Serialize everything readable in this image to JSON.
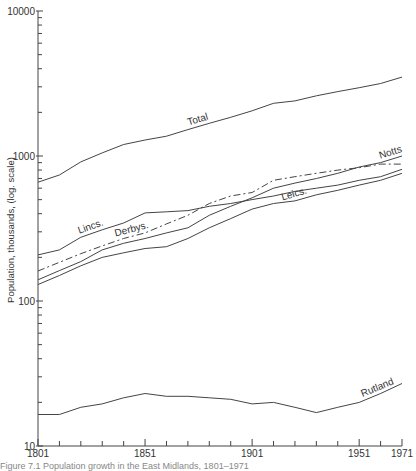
{
  "chart_data": {
    "type": "line",
    "title": "",
    "xlabel": "",
    "ylabel": "Population, thousands, (log. scale)",
    "yscale": "log",
    "ylim": [
      10,
      10000
    ],
    "xlim": [
      1801,
      1971
    ],
    "grid": false,
    "legend": "inline labels",
    "y_ticks": [
      10,
      100,
      1000,
      10000
    ],
    "y_tick_labels": [
      "10",
      "100",
      "1000",
      "10000"
    ],
    "x_tick_labels": [
      "1801",
      "1851",
      "1901",
      "1951",
      "1971"
    ],
    "x_label_years": [
      1801,
      1851,
      1901,
      1951,
      1971
    ],
    "x_minor_tick_step": 10,
    "x": [
      1801,
      1811,
      1821,
      1831,
      1841,
      1851,
      1861,
      1871,
      1881,
      1891,
      1901,
      1911,
      1921,
      1931,
      1941,
      1951,
      1961,
      1971
    ],
    "series": [
      {
        "name": "Total",
        "style": "solid",
        "label_year": 1876,
        "values": [
          660,
          740,
          910,
          1050,
          1200,
          1290,
          1370,
          1520,
          1680,
          1850,
          2050,
          2310,
          2400,
          2600,
          2780,
          2960,
          3160,
          3500
        ]
      },
      {
        "name": "Lincs.",
        "style": "solid",
        "label_year": 1826,
        "values": [
          208,
          225,
          275,
          310,
          345,
          405,
          412,
          420,
          450,
          470,
          500,
          530,
          570,
          600,
          630,
          680,
          720,
          810
        ]
      },
      {
        "name": "Derbys.",
        "style": "dashed",
        "label_year": 1845,
        "values": [
          161,
          185,
          212,
          240,
          270,
          295,
          340,
          390,
          470,
          530,
          560,
          680,
          720,
          760,
          800,
          830,
          880,
          880
        ]
      },
      {
        "name": "Notts",
        "style": "solid",
        "label_year": 1966,
        "values": [
          140,
          162,
          187,
          225,
          250,
          270,
          295,
          320,
          390,
          450,
          515,
          600,
          650,
          700,
          760,
          840,
          900,
          1000
        ]
      },
      {
        "name": "Leics.",
        "style": "solid",
        "label_year": 1921,
        "values": [
          130,
          150,
          175,
          200,
          215,
          230,
          237,
          270,
          320,
          370,
          430,
          470,
          490,
          540,
          580,
          630,
          680,
          760
        ]
      },
      {
        "name": "Rutland",
        "style": "solid",
        "label_year": 1960,
        "values": [
          16.5,
          16.5,
          18.5,
          19.5,
          21.5,
          23,
          22,
          22,
          21.5,
          21,
          19.5,
          20,
          18.5,
          17,
          18.5,
          20,
          23,
          27
        ]
      }
    ]
  },
  "caption": "Figure 7.1 Population growth in the East Midlands, 1801–1971"
}
